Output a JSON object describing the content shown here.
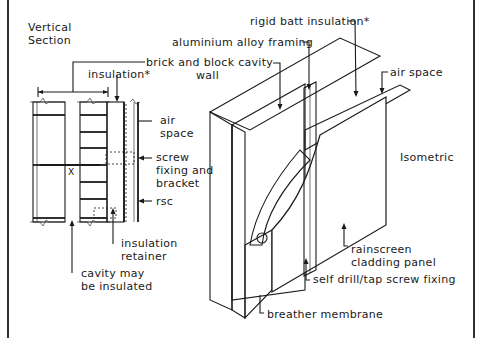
{
  "diagram": {
    "views": {
      "section_title": [
        "Vertical",
        "Section"
      ],
      "isometric_title": "Isometric"
    },
    "labels": {
      "rigid_batt": "rigid batt insulation*",
      "aluminium_framing": "aluminium alloy framing",
      "brick_block": [
        "brick and block cavity",
        "wall"
      ],
      "insulation": "insulation*",
      "air_space_section": [
        "air",
        "space"
      ],
      "air_space_iso": "air space",
      "screw_fixing": [
        "screw",
        "fixing and",
        "bracket"
      ],
      "rsc": "rsc",
      "insulation_retainer": [
        "insulation",
        "retainer"
      ],
      "cavity": [
        "cavity may",
        "be insulated"
      ],
      "rainscreen": [
        "rainscreen",
        "cladding panel"
      ],
      "self_drill": "self drill/tap screw fixing",
      "breather": "breather membrane",
      "dim_x": "X"
    }
  }
}
